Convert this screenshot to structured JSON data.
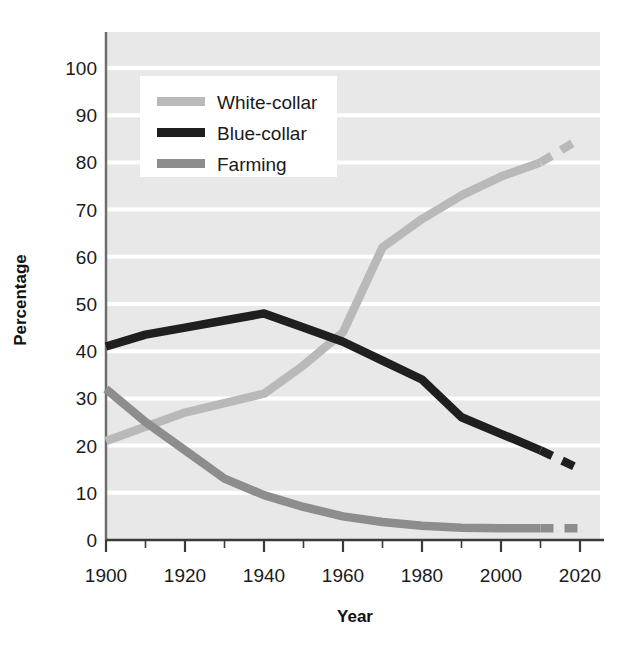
{
  "chart_data": {
    "type": "line",
    "title": "",
    "xlabel": "Year",
    "ylabel": "Percentage",
    "xlim": [
      1900,
      2020
    ],
    "ylim": [
      0,
      100
    ],
    "xticks": [
      1900,
      1920,
      1940,
      1960,
      1980,
      2000,
      2020
    ],
    "xtick_labels": [
      "1900",
      "1920",
      "1940",
      "1960",
      "1980",
      "2000",
      "2020"
    ],
    "x_minor_tick_interval": 10,
    "yticks": [
      0,
      10,
      20,
      30,
      40,
      50,
      60,
      70,
      80,
      90,
      100
    ],
    "ytick_labels": [
      "0",
      "10",
      "20",
      "30",
      "40",
      "50",
      "60",
      "70",
      "80",
      "90",
      "100"
    ],
    "grid": "horizontal",
    "grid_color": "#ffffff",
    "plot_background": "#e8e8e8",
    "legend_position": "upper-left",
    "series": [
      {
        "name": "White-collar",
        "color": "#b9b9b9",
        "x": [
          1900,
          1910,
          1920,
          1930,
          1940,
          1950,
          1960,
          1970,
          1980,
          1990,
          2000,
          2010
        ],
        "values": [
          21,
          24,
          27,
          29,
          31,
          37,
          44,
          62,
          68,
          73,
          77,
          80
        ],
        "projected_x": [
          2010,
          2020
        ],
        "projected_values": [
          80,
          85
        ],
        "projection_style": "dashed"
      },
      {
        "name": "Blue-collar",
        "color": "#1f1f1f",
        "x": [
          1900,
          1910,
          1920,
          1930,
          1940,
          1950,
          1960,
          1970,
          1980,
          1990,
          2000,
          2010
        ],
        "values": [
          41,
          43.5,
          45,
          46.5,
          48,
          45,
          42,
          38,
          34,
          26,
          22.5,
          19
        ],
        "projected_x": [
          2010,
          2020
        ],
        "projected_values": [
          19,
          15
        ],
        "projection_style": "dashed"
      },
      {
        "name": "Farming",
        "color": "#8d8d8d",
        "x": [
          1900,
          1910,
          1920,
          1930,
          1940,
          1950,
          1960,
          1970,
          1980,
          1990,
          2000,
          2010
        ],
        "values": [
          32,
          25,
          19,
          13,
          9.5,
          7,
          5,
          3.8,
          3,
          2.6,
          2.5,
          2.5
        ],
        "projected_x": [
          2010,
          2020
        ],
        "projected_values": [
          2.5,
          2.5
        ],
        "projection_style": "dashed"
      }
    ]
  },
  "legend": {
    "items": [
      {
        "label": "White-collar",
        "color": "#b9b9b9"
      },
      {
        "label": "Blue-collar",
        "color": "#1f1f1f"
      },
      {
        "label": "Farming",
        "color": "#8d8d8d"
      }
    ]
  },
  "axes": {
    "x_title": "Year",
    "y_title": "Percentage"
  },
  "ticks": {
    "x": [
      "1900",
      "1920",
      "1940",
      "1960",
      "1980",
      "2000",
      "2020"
    ],
    "y": [
      "0",
      "10",
      "20",
      "30",
      "40",
      "50",
      "60",
      "70",
      "80",
      "90",
      "100"
    ]
  }
}
